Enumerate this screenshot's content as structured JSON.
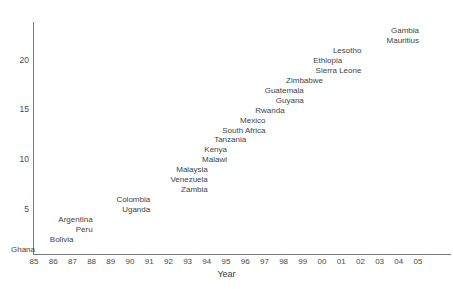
{
  "chart_data": {
    "type": "scatter",
    "title": "",
    "subtitle": "",
    "xlabel": "Year",
    "ylabel": "",
    "grid": false,
    "legend": "none",
    "marker_style": "text-label-only",
    "xlim": [
      85,
      105.5
    ],
    "ylim": [
      0,
      23.4
    ],
    "xticklabels": [
      "85",
      "86",
      "87",
      "88",
      "89",
      "90",
      "91",
      "92",
      "93",
      "94",
      "95",
      "96",
      "97",
      "98",
      "99",
      "00",
      "01",
      "02",
      "03",
      "04",
      "05"
    ],
    "xtickvalues": [
      1985,
      1986,
      1987,
      1988,
      1989,
      1990,
      1991,
      1992,
      1993,
      1994,
      1995,
      1996,
      1997,
      1998,
      1999,
      2000,
      2001,
      2002,
      2003,
      2004,
      2005
    ],
    "yticklabels": [
      "5",
      "10",
      "15",
      "20"
    ],
    "ytickvalues": [
      5,
      10,
      15,
      20
    ],
    "point_label_position": "left-of-point",
    "points": [
      {
        "label": "Ghana",
        "x": 1985,
        "y": 1
      },
      {
        "label": "Bolivia",
        "x": 1987,
        "y": 2
      },
      {
        "label": "Peru",
        "x": 1988,
        "y": 3
      },
      {
        "label": "Argentina",
        "x": 1988,
        "y": 4
      },
      {
        "label": "Uganda",
        "x": 1991,
        "y": 5
      },
      {
        "label": "Colombia",
        "x": 1991,
        "y": 6
      },
      {
        "label": "Zambia",
        "x": 1994,
        "y": 7
      },
      {
        "label": "Venezuela",
        "x": 1994,
        "y": 8
      },
      {
        "label": "Malaysia",
        "x": 1994,
        "y": 9
      },
      {
        "label": "Malawi",
        "x": 1995,
        "y": 10
      },
      {
        "label": "Kenya",
        "x": 1995,
        "y": 11
      },
      {
        "label": "Tanzania",
        "x": 1996,
        "y": 12
      },
      {
        "label": "South Africa",
        "x": 1997,
        "y": 13
      },
      {
        "label": "Mexico",
        "x": 1997,
        "y": 14
      },
      {
        "label": "Rwanda",
        "x": 1998,
        "y": 15
      },
      {
        "label": "Guyana",
        "x": 1999,
        "y": 16
      },
      {
        "label": "Guatemala",
        "x": 1999,
        "y": 17
      },
      {
        "label": "Zimbabwe",
        "x": 2000,
        "y": 18
      },
      {
        "label": "Sierra Leone",
        "x": 2002,
        "y": 19
      },
      {
        "label": "Ethiopia",
        "x": 2001,
        "y": 20
      },
      {
        "label": "Lesotho",
        "x": 2002,
        "y": 21
      },
      {
        "label": "Mauritius",
        "x": 2005,
        "y": 22
      },
      {
        "label": "Gambia",
        "x": 2005,
        "y": 23
      }
    ]
  },
  "axis": {
    "x_title": "Year"
  }
}
